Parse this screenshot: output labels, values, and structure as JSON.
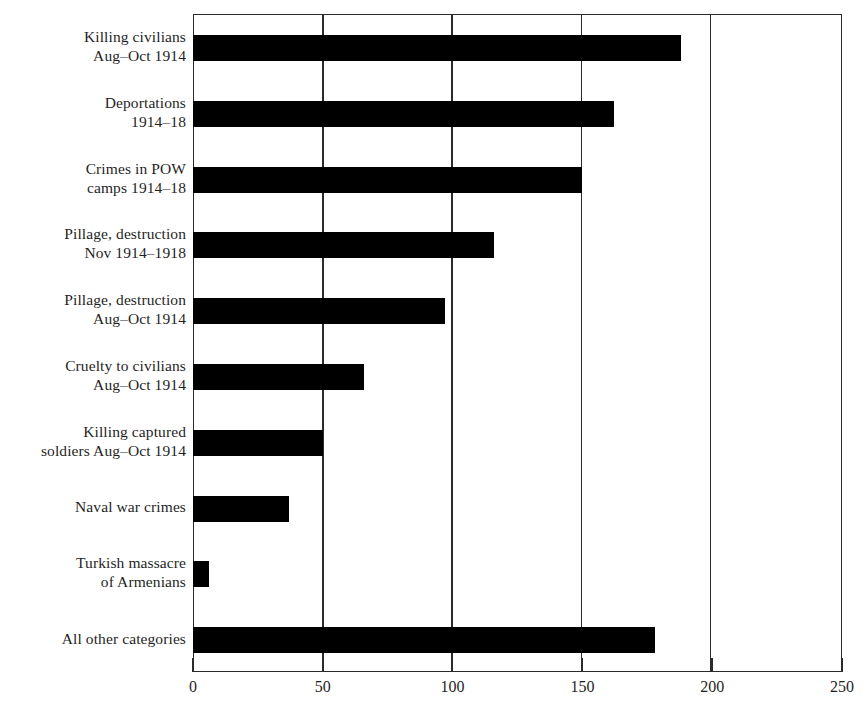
{
  "chart_data": {
    "type": "bar",
    "orientation": "horizontal",
    "title": "",
    "subtitle": "",
    "xlabel": "",
    "ylabel": "",
    "xlim": [
      0,
      250
    ],
    "ylim": null,
    "grid": true,
    "legend": null,
    "xticks": [
      0,
      50,
      100,
      150,
      200,
      250
    ],
    "xtick_labels": [
      "0",
      "50",
      "100",
      "150",
      "200",
      "250"
    ],
    "bar_color": "#000000",
    "axis_color": "#2b2b2b",
    "background_color": "#ffffff",
    "categories": [
      "Killing civilians Aug–Oct 1914",
      "Deportations 1914–18",
      "Crimes in POW camps 1914–18",
      "Pillage, destruction Nov 1914–1918",
      "Pillage, destruction Aug–Oct 1914",
      "Cruelty to civilians Aug–Oct 1914",
      "Killing captured soldiers Aug–Oct 1914",
      "Naval war crimes",
      "Turkish massacre of Armenians",
      "All other categories"
    ],
    "category_lines": [
      [
        "Killing civilians",
        "Aug–Oct 1914"
      ],
      [
        "Deportations",
        "1914–18"
      ],
      [
        "Crimes in POW",
        "camps 1914–18"
      ],
      [
        "Pillage, destruction",
        "Nov 1914–1918"
      ],
      [
        "Pillage, destruction",
        "Aug–Oct 1914"
      ],
      [
        "Cruelty to civilians",
        "Aug–Oct 1914"
      ],
      [
        "Killing captured",
        "soldiers Aug–Oct 1914"
      ],
      [
        "Naval war crimes",
        ""
      ],
      [
        "Turkish massacre",
        "of Armenians"
      ],
      [
        "All other categories",
        ""
      ]
    ],
    "values": [
      188,
      162,
      150,
      116,
      97,
      66,
      50,
      37,
      6,
      178
    ],
    "annotations": []
  }
}
